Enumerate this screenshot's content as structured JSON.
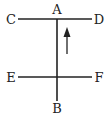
{
  "diagram": {
    "labels": {
      "A": "A",
      "B": "B",
      "C": "C",
      "D": "D",
      "E": "E",
      "F": "F"
    },
    "arrow": {
      "direction": "up"
    },
    "colors": {
      "line": "#222222",
      "background": "#ffffff"
    }
  }
}
